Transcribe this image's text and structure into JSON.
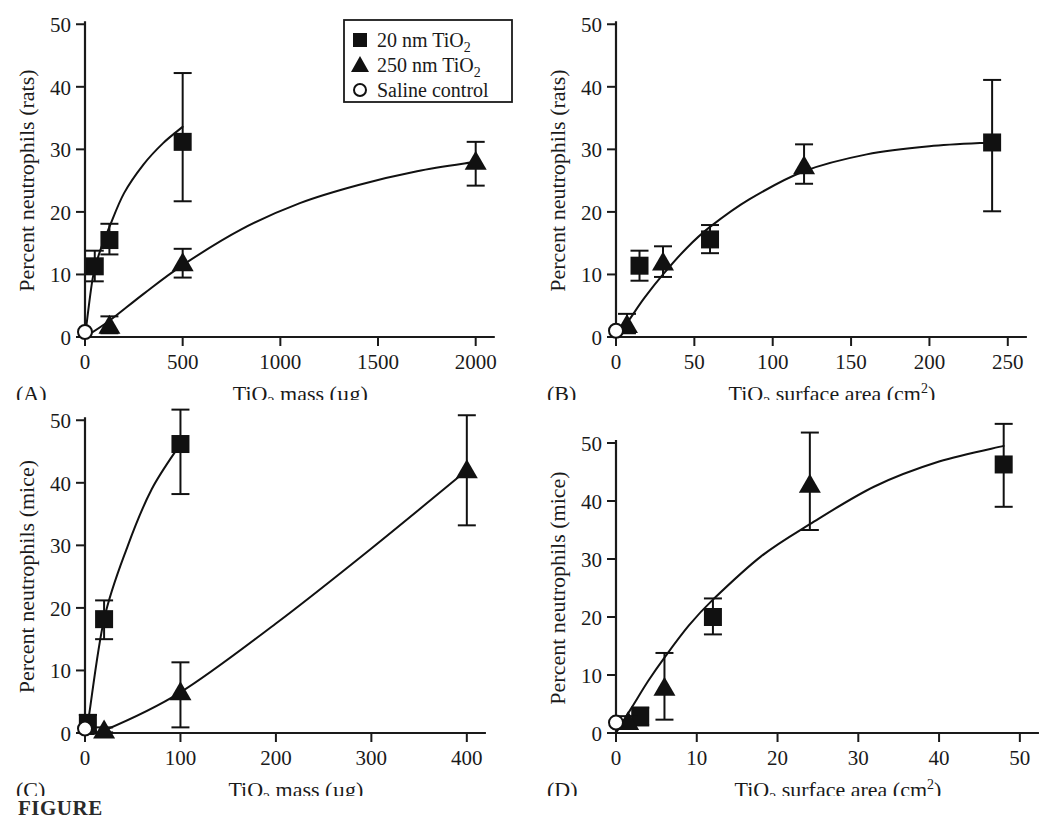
{
  "figure": {
    "caption_fragment": "FIGURE",
    "panel_count": 4,
    "colors": {
      "ink": "#111111",
      "background": "#ffffff"
    }
  },
  "legend": {
    "position": "panel-A top-right",
    "entries": [
      {
        "marker": "filled-square",
        "label_main": "20 nm TiO",
        "label_sub": "2"
      },
      {
        "marker": "filled-triangle",
        "label_main": "250 nm TiO",
        "label_sub": "2"
      },
      {
        "marker": "open-circle",
        "label_main": "Saline control",
        "label_sub": ""
      }
    ]
  },
  "chart_data": [
    {
      "id": "A",
      "type": "scatter",
      "panel_label": "(A)",
      "title": "",
      "xlabel_main": "TiO",
      "xlabel_sub": "2",
      "xlabel_rest": " mass (µg)",
      "ylabel": "Percent neutrophils (rats)",
      "xlim": [
        0,
        2150
      ],
      "ylim": [
        0,
        51
      ],
      "xticks": [
        0,
        500,
        1000,
        1500,
        2000
      ],
      "yticks": [
        0,
        10,
        20,
        30,
        40,
        50
      ],
      "grid": false,
      "series": [
        {
          "name": "20 nm TiO2",
          "marker": "filled-square",
          "x": [
            50,
            125,
            500
          ],
          "y": [
            11.3,
            15.5,
            31.2
          ],
          "yerr_low": [
            2.4,
            2.3,
            9.5
          ],
          "yerr_high": [
            2.5,
            2.6,
            11.0
          ]
        },
        {
          "name": "250 nm TiO2",
          "marker": "filled-triangle",
          "x": [
            125,
            500,
            2000
          ],
          "y": [
            1.8,
            11.8,
            28.0
          ],
          "yerr_low": [
            1.2,
            2.3,
            3.8
          ],
          "yerr_high": [
            1.5,
            2.3,
            3.2
          ]
        },
        {
          "name": "Saline control",
          "marker": "open-circle",
          "x": [
            0
          ],
          "y": [
            0.8
          ],
          "yerr_low": [
            0
          ],
          "yerr_high": [
            0
          ]
        }
      ],
      "fit_curves": [
        {
          "for": "20 nm TiO2",
          "points": [
            [
              0,
              0
            ],
            [
              40,
              9.5
            ],
            [
              80,
              14.0
            ],
            [
              125,
              17.6
            ],
            [
              200,
              23.0
            ],
            [
              300,
              27.6
            ],
            [
              400,
              31.0
            ],
            [
              500,
              33.6
            ]
          ]
        },
        {
          "for": "250 nm TiO2",
          "points": [
            [
              0,
              0
            ],
            [
              125,
              2.6
            ],
            [
              300,
              6.9
            ],
            [
              500,
              11.5
            ],
            [
              800,
              17.2
            ],
            [
              1100,
              21.4
            ],
            [
              1400,
              24.3
            ],
            [
              1700,
              26.5
            ],
            [
              2000,
              28.0
            ]
          ]
        }
      ]
    },
    {
      "id": "B",
      "type": "scatter",
      "panel_label": "(B)",
      "title": "",
      "xlabel_main": "TiO",
      "xlabel_sub": "2",
      "xlabel_rest": " surface area (cm",
      "xlabel_sup": "2",
      "xlabel_tail": ")",
      "ylabel": "Percent neutrophils (rats)",
      "xlim": [
        0,
        268
      ],
      "ylim": [
        0,
        51
      ],
      "xticks": [
        0,
        50,
        100,
        150,
        200,
        250
      ],
      "yticks": [
        0,
        10,
        20,
        30,
        40,
        50
      ],
      "grid": false,
      "series": [
        {
          "name": "20 nm TiO2",
          "marker": "filled-square",
          "x": [
            15,
            60,
            240
          ],
          "y": [
            11.4,
            15.6,
            31.1
          ],
          "yerr_low": [
            2.4,
            2.2,
            11.0
          ],
          "yerr_high": [
            2.4,
            2.3,
            10.0
          ]
        },
        {
          "name": "250 nm TiO2",
          "marker": "filled-triangle",
          "x": [
            7,
            30,
            120
          ],
          "y": [
            1.9,
            11.9,
            27.3
          ],
          "yerr_low": [
            1.3,
            2.3,
            2.8
          ],
          "yerr_high": [
            1.8,
            2.6,
            3.5
          ]
        },
        {
          "name": "Saline control",
          "marker": "open-circle",
          "x": [
            0
          ],
          "y": [
            1.0
          ],
          "yerr_low": [
            0
          ],
          "yerr_high": [
            0
          ]
        }
      ],
      "fit_curves": [
        {
          "for": "combined",
          "points": [
            [
              0,
              0
            ],
            [
              8,
              2.6
            ],
            [
              18,
              6.2
            ],
            [
              30,
              10.0
            ],
            [
              45,
              14.2
            ],
            [
              60,
              17.6
            ],
            [
              85,
              22.0
            ],
            [
              120,
              26.5
            ],
            [
              160,
              29.2
            ],
            [
              200,
              30.5
            ],
            [
              240,
              31.1
            ]
          ]
        }
      ]
    },
    {
      "id": "C",
      "type": "scatter",
      "panel_label": "(C)",
      "title": "",
      "xlabel_main": "TiO",
      "xlabel_sub": "2",
      "xlabel_rest": " mass (µg)",
      "ylabel": "Percent neutrophils (mice)",
      "xlim": [
        0,
        440
      ],
      "ylim": [
        0,
        51
      ],
      "xticks": [
        0,
        100,
        200,
        300,
        400
      ],
      "yticks": [
        0,
        10,
        20,
        30,
        40,
        50
      ],
      "grid": false,
      "series": [
        {
          "name": "20 nm TiO2",
          "marker": "filled-square",
          "x": [
            3,
            20,
            100
          ],
          "y": [
            1.6,
            18.2,
            46.2
          ],
          "yerr_low": [
            1.2,
            3.2,
            8.0
          ],
          "yerr_high": [
            1.3,
            3.0,
            5.5
          ]
        },
        {
          "name": "250 nm TiO2",
          "marker": "filled-triangle",
          "x": [
            20,
            100,
            400
          ],
          "y": [
            0.4,
            6.5,
            42.0
          ],
          "yerr_low": [
            0.3,
            5.6,
            8.8
          ],
          "yerr_high": [
            0.5,
            4.8,
            8.8
          ]
        },
        {
          "name": "Saline control",
          "marker": "open-circle",
          "x": [
            0
          ],
          "y": [
            0.7
          ],
          "yerr_low": [
            0
          ],
          "yerr_high": [
            0
          ]
        }
      ],
      "fit_curves": [
        {
          "for": "20 nm TiO2",
          "points": [
            [
              0,
              0
            ],
            [
              3,
              1.6
            ],
            [
              20,
              18.2
            ],
            [
              45,
              30.0
            ],
            [
              70,
              39.0
            ],
            [
              100,
              46.2
            ]
          ]
        },
        {
          "for": "250 nm TiO2",
          "points": [
            [
              0,
              0
            ],
            [
              20,
              0.4
            ],
            [
              100,
              6.5
            ],
            [
              200,
              17.5
            ],
            [
              300,
              29.5
            ],
            [
              400,
              42.0
            ]
          ]
        }
      ]
    },
    {
      "id": "D",
      "type": "scatter",
      "panel_label": "(D)",
      "title": "",
      "xlabel_main": "TiO",
      "xlabel_sub": "2",
      "xlabel_rest": " surface area (cm",
      "xlabel_sup": "2",
      "xlabel_tail": ")",
      "ylabel": "Percent neutrophils (mice)",
      "xlim": [
        0,
        52
      ],
      "ylim": [
        0,
        55
      ],
      "xticks": [
        0,
        10,
        20,
        30,
        40,
        50
      ],
      "yticks": [
        0,
        10,
        20,
        30,
        40,
        50
      ],
      "grid": false,
      "series": [
        {
          "name": "20 nm TiO2",
          "marker": "filled-square",
          "x": [
            3,
            12,
            48
          ],
          "y": [
            2.9,
            20.0,
            46.3
          ],
          "yerr_low": [
            1.6,
            3.0,
            7.3
          ],
          "yerr_high": [
            1.5,
            3.2,
            7.0
          ]
        },
        {
          "name": "250 nm TiO2",
          "marker": "filled-triangle",
          "x": [
            1.5,
            6,
            24
          ],
          "y": [
            1.9,
            7.8,
            42.8
          ],
          "yerr_low": [
            1.0,
            5.5,
            7.8
          ],
          "yerr_high": [
            1.0,
            6.0,
            9.0
          ]
        },
        {
          "name": "Saline control",
          "marker": "open-circle",
          "x": [
            0
          ],
          "y": [
            1.8
          ],
          "yerr_low": [
            0
          ],
          "yerr_high": [
            0
          ]
        }
      ],
      "fit_curves": [
        {
          "for": "combined",
          "points": [
            [
              0,
              0
            ],
            [
              2,
              4.5
            ],
            [
              4,
              9.0
            ],
            [
              6,
              13.0
            ],
            [
              9,
              18.5
            ],
            [
              12,
              23.0
            ],
            [
              18,
              30.5
            ],
            [
              24,
              36.0
            ],
            [
              32,
              42.5
            ],
            [
              40,
              46.8
            ],
            [
              48,
              49.5
            ]
          ]
        }
      ]
    }
  ]
}
